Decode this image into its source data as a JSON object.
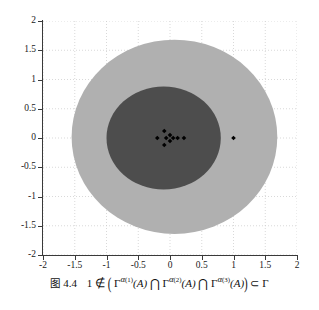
{
  "figure": {
    "caption_label": "图",
    "caption_number": "4.4",
    "caption_math_plain": "1 ∉ (Γ^{α^{(1)}}(A) ⋂ Γ^{α^{(2)}}(A) ⋂ Γ^{α^{(3)}}(A)) ⊂ Γ",
    "caption_tokens": {
      "one": "1",
      "notin": "∉",
      "lparen": "(",
      "gamma": "Γ",
      "alpha": "α",
      "sup1": "(1)",
      "sup2": "(2)",
      "sup3": "(3)",
      "argA": "(A)",
      "cap": "⋂",
      "rparen": ")",
      "subset": "⊂",
      "gamma_last": "Γ"
    }
  },
  "chart_data": {
    "type": "scatter",
    "title": "",
    "xlabel": "",
    "ylabel": "",
    "xlim": [
      -2,
      2
    ],
    "ylim": [
      -2,
      2
    ],
    "grid": true,
    "grid_style": "dotted",
    "xticks": [
      "-2",
      "-1.5",
      "-1",
      "-0.5",
      "0",
      "0.5",
      "1",
      "1.5",
      "2"
    ],
    "xtick_values": [
      -2,
      -1.5,
      -1,
      -0.5,
      0,
      0.5,
      1,
      1.5,
      2
    ],
    "yticks": [
      "2",
      "1.5",
      "1",
      "0.5",
      "0",
      "-0.5",
      "-1",
      "-1.5",
      "-2"
    ],
    "ytick_values": [
      2,
      1.5,
      1,
      0.5,
      0,
      -0.5,
      -1,
      -1.5,
      -2
    ],
    "colors": {
      "outer_region": "#b0b0b0",
      "inner_region": "#4d4d4d",
      "points": "#000000",
      "grid": "#c8c8c8",
      "axis": "#3a3a3a",
      "background": "#ffffff"
    },
    "regions": [
      {
        "name": "Gamma",
        "shape": "ellipse",
        "cx": 0.07,
        "cy": 0.02,
        "rx": 1.62,
        "ry": 1.66,
        "color": "#b0b0b0",
        "label": "Γ"
      },
      {
        "name": "intersection-of-Gamma-alpha",
        "shape": "ellipse",
        "cx": -0.1,
        "cy": 0.0,
        "rx": 0.9,
        "ry": 0.88,
        "color": "#4d4d4d",
        "label": "Γ^{α(1)}(A) ⋂ Γ^{α(2)}(A) ⋂ Γ^{α(3)}(A)"
      }
    ],
    "series": [
      {
        "name": "eigenvalues",
        "marker": "diamond",
        "color": "#000000",
        "points": [
          [
            -0.2,
            0.0
          ],
          [
            -0.09,
            0.12
          ],
          [
            -0.09,
            -0.12
          ],
          [
            -0.06,
            0.0
          ],
          [
            0.0,
            0.05
          ],
          [
            0.0,
            -0.05
          ],
          [
            0.05,
            0.0
          ],
          [
            0.12,
            0.0
          ],
          [
            0.22,
            0.0
          ],
          [
            1.0,
            0.0
          ]
        ]
      }
    ],
    "annotations": [
      {
        "text": "1",
        "x": 1.0,
        "y": 0.0,
        "note": "isolated point outside inner region"
      }
    ]
  }
}
